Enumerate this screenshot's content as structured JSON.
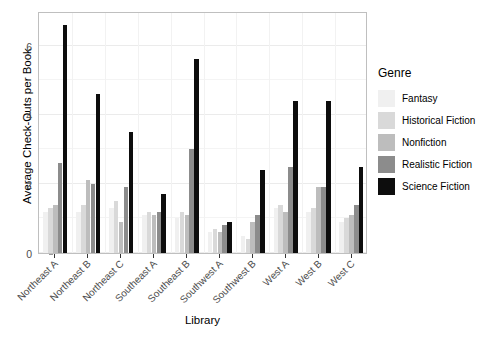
{
  "chart_data": {
    "type": "bar",
    "title": "",
    "xlabel": "Library",
    "ylabel": "Average Check-Outs per Book",
    "categories": [
      "Northeast A",
      "Northeast B",
      "Northeast C",
      "Southeast A",
      "Southeast B",
      "Southwest A",
      "Southwest B",
      "West A",
      "West B",
      "West C"
    ],
    "series": [
      {
        "name": "Fantasy",
        "color": "#f0f0f0",
        "values": [
          1.2,
          1.2,
          1.3,
          1.1,
          1.0,
          0.6,
          0.5,
          1.3,
          1.2,
          0.9
        ]
      },
      {
        "name": "Historical Fiction",
        "color": "#d9d9d9",
        "values": [
          1.3,
          1.4,
          1.5,
          1.2,
          1.2,
          0.7,
          0.4,
          1.4,
          1.3,
          1.0
        ]
      },
      {
        "name": "Nonfiction",
        "color": "#bdbdbd",
        "values": [
          1.4,
          2.1,
          0.9,
          1.1,
          1.1,
          0.6,
          0.9,
          1.2,
          1.9,
          1.1
        ]
      },
      {
        "name": "Realistic Fiction",
        "color": "#8c8c8c",
        "values": [
          2.6,
          2.0,
          1.9,
          1.2,
          3.0,
          0.8,
          1.1,
          2.5,
          1.9,
          1.4
        ]
      },
      {
        "name": "Science Fiction",
        "color": "#0d0d0d",
        "values": [
          6.6,
          4.6,
          3.5,
          1.7,
          5.6,
          0.9,
          2.4,
          4.4,
          4.4,
          2.5
        ]
      }
    ],
    "ylim": [
      0,
      7
    ],
    "y_ticks": [
      0,
      2,
      4,
      6
    ],
    "y_tick_labels": [
      "0",
      "2",
      "4",
      "6"
    ],
    "grid": true,
    "legend_position": "right",
    "legend_title": "Genre",
    "panel_background": "#ffffff",
    "grid_color": "#ebebeb",
    "axis_text_color": "#4d4d4d"
  }
}
